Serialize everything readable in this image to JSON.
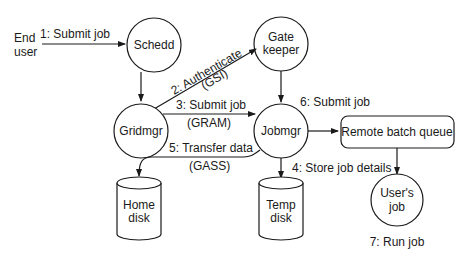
{
  "diagram": {
    "actors": {
      "end_user": [
        "End",
        "user"
      ]
    },
    "nodes": {
      "schedd": "Schedd",
      "gatekeeper": [
        "Gate",
        "keeper"
      ],
      "gridmgr": "Gridmgr",
      "jobmgr": "Jobmgr",
      "remote_batch_queue": "Remote batch queue",
      "users_job": [
        "User's",
        "job"
      ],
      "home_disk": [
        "Home",
        "disk"
      ],
      "temp_disk": [
        "Temp",
        "disk"
      ]
    },
    "edges": {
      "e1": "1: Submit job",
      "e2": "2: Authenticate",
      "e2_proto": "(GSI)",
      "e3": "3: Submit job",
      "e3_proto": "(GRAM)",
      "e4": "4: Store job details",
      "e5": "5: Transfer data",
      "e5_proto": "(GASS)",
      "e6": "6: Submit job",
      "e7": "7: Run job"
    },
    "colors": {
      "stroke": "#1a1a1a",
      "background": "#ffffff"
    }
  }
}
